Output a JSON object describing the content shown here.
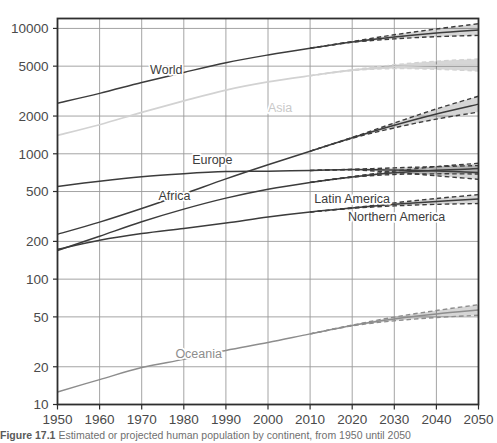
{
  "figure": {
    "caption_prefix": "Figure 17.1",
    "caption_text": "Estimated or projected human population by continent, from 1950 until 2050"
  },
  "chart_data": {
    "type": "line",
    "title": "",
    "xlabel": "",
    "ylabel": "",
    "yscale": "log",
    "xlim": [
      1950,
      2050
    ],
    "ylim": [
      10,
      12000
    ],
    "grid": true,
    "legend": "inline-labels",
    "xticks": [
      1950,
      1960,
      1970,
      1980,
      1990,
      2000,
      2010,
      2020,
      2030,
      2040,
      2050
    ],
    "yticks": [
      10,
      20,
      50,
      100,
      200,
      500,
      1000,
      2000,
      5000,
      10000
    ],
    "ytick_labels": [
      "10",
      "20",
      "50",
      "100",
      "200",
      "500",
      "1000",
      "2000",
      "5000",
      "10000"
    ],
    "xtick_labels": [
      "1950",
      "1960",
      "1970",
      "1980",
      "1990",
      "2000",
      "2010",
      "2020",
      "2030",
      "2040",
      "2050"
    ],
    "units": "millions of people",
    "projection_start_year": 2020,
    "annotations": [
      {
        "label": "World",
        "x": 1972,
        "y": 4300,
        "color": "#3c3c3c"
      },
      {
        "label": "Asia",
        "x": 2000,
        "y": 2150,
        "color": "#c9c9c9"
      },
      {
        "label": "Europe",
        "x": 1982,
        "y": 830,
        "color": "#3c3c3c"
      },
      {
        "label": "Africa",
        "x": 1974,
        "y": 430,
        "color": "#3c3c3c"
      },
      {
        "label": "Latin America",
        "x": 2011,
        "y": 405,
        "color": "#3c3c3c"
      },
      {
        "label": "Northern America",
        "x": 2019,
        "y": 290,
        "color": "#3c3c3c"
      },
      {
        "label": "Oceania",
        "x": 1978,
        "y": 23.5,
        "color": "#8d8d8d"
      }
    ],
    "x": [
      1950,
      1960,
      1970,
      1980,
      1990,
      2000,
      2010,
      2020,
      2030,
      2040,
      2050
    ],
    "series": [
      {
        "name": "World",
        "color": "#3c3c3c",
        "values": [
          2536,
          3034,
          3700,
          4458,
          5327,
          6143,
          6957,
          7795,
          8548,
          9199,
          9735
        ],
        "upper": [
          2536,
          3034,
          3700,
          4458,
          5327,
          6143,
          6957,
          7860,
          8900,
          9900,
          10900
        ],
        "lower": [
          2536,
          3034,
          3700,
          4458,
          5327,
          6143,
          6957,
          7740,
          8250,
          8600,
          8800
        ]
      },
      {
        "name": "Asia",
        "color": "#d2d2d2",
        "values": [
          1405,
          1706,
          2138,
          2642,
          3221,
          3741,
          4194,
          4641,
          4947,
          5085,
          5098
        ],
        "upper": [
          1405,
          1706,
          2138,
          2642,
          3221,
          3741,
          4194,
          4680,
          5130,
          5480,
          5700
        ],
        "lower": [
          1405,
          1706,
          2138,
          2642,
          3221,
          3741,
          4194,
          4610,
          4780,
          4720,
          4570
        ]
      },
      {
        "name": "Africa",
        "color": "#3c3c3c",
        "values": [
          228,
          285,
          366,
          478,
          631,
          818,
          1049,
          1341,
          1688,
          2077,
          2489
        ],
        "upper": [
          228,
          285,
          366,
          478,
          631,
          818,
          1049,
          1350,
          1760,
          2280,
          2880
        ],
        "lower": [
          228,
          285,
          366,
          478,
          631,
          818,
          1049,
          1330,
          1610,
          1890,
          2150
        ]
      },
      {
        "name": "Europe",
        "color": "#3c3c3c",
        "values": [
          549,
          605,
          657,
          694,
          721,
          726,
          736,
          748,
          741,
          728,
          710
        ],
        "upper": [
          549,
          605,
          657,
          694,
          721,
          726,
          736,
          752,
          772,
          790,
          805
        ],
        "lower": [
          549,
          605,
          657,
          694,
          721,
          726,
          736,
          744,
          710,
          668,
          625
        ]
      },
      {
        "name": "Latin America",
        "color": "#3c3c3c",
        "values": [
          169,
          220,
          287,
          362,
          443,
          522,
          591,
          654,
          706,
          740,
          762
        ],
        "upper": [
          169,
          220,
          287,
          362,
          443,
          522,
          591,
          658,
          728,
          790,
          840
        ],
        "lower": [
          169,
          220,
          287,
          362,
          443,
          522,
          591,
          650,
          684,
          692,
          690
        ]
      },
      {
        "name": "Northern America",
        "color": "#3c3c3c",
        "values": [
          173,
          204,
          231,
          254,
          280,
          313,
          343,
          369,
          395,
          417,
          435
        ],
        "upper": [
          173,
          204,
          231,
          254,
          280,
          313,
          343,
          371,
          406,
          440,
          472
        ],
        "lower": [
          173,
          204,
          231,
          254,
          280,
          313,
          343,
          367,
          384,
          395,
          401
        ]
      },
      {
        "name": "Oceania",
        "color": "#8d8d8d",
        "values": [
          12.6,
          15.8,
          19.7,
          22.9,
          27.0,
          31.2,
          36.6,
          42.7,
          48.1,
          52.7,
          56.7
        ],
        "upper": [
          12.6,
          15.8,
          19.7,
          22.9,
          27.0,
          31.2,
          36.6,
          43.0,
          49.8,
          56.2,
          62.5
        ],
        "lower": [
          12.6,
          15.8,
          19.7,
          22.9,
          27.0,
          31.2,
          36.6,
          42.4,
          46.5,
          49.4,
          51.5
        ]
      }
    ]
  }
}
